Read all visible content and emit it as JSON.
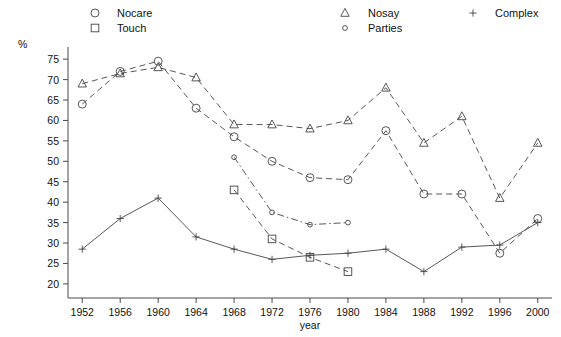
{
  "chart_data": {
    "type": "line",
    "title": "",
    "xlabel": "year",
    "ylabel": "%",
    "x": [
      1952,
      1956,
      1960,
      1964,
      1968,
      1972,
      1976,
      1980,
      1984,
      1988,
      1992,
      1996,
      2000
    ],
    "xticklabels": [
      "1952",
      "1956",
      "1960",
      "1964",
      "1968",
      "1972",
      "1976",
      "1980",
      "1984",
      "1988",
      "1992",
      "1996",
      "2000"
    ],
    "yticks": [
      20,
      25,
      30,
      35,
      40,
      45,
      50,
      55,
      60,
      65,
      70,
      75
    ],
    "yticklabels": [
      "20",
      "25",
      "30",
      "35",
      "40",
      "45",
      "50",
      "55",
      "60",
      "65",
      "70",
      "75"
    ],
    "ylim": [
      18.5,
      77
    ],
    "xlim": [
      1950.5,
      2001.5
    ],
    "grid": false,
    "legend_position": "top",
    "series": [
      {
        "name": "Nocare",
        "marker": "circle",
        "linestyle": "dashed",
        "color": "#444444",
        "x": [
          1952,
          1956,
          1960,
          1964,
          1968,
          1972,
          1976,
          1980,
          1984,
          1988,
          1992,
          1996,
          2000
        ],
        "values": [
          64.0,
          72.0,
          74.5,
          63.0,
          56.0,
          50.0,
          46.0,
          45.5,
          57.5,
          42.0,
          42.0,
          27.5,
          36.0
        ]
      },
      {
        "name": "Touch",
        "marker": "square",
        "linestyle": "dashed",
        "color": "#444444",
        "x": [
          1968,
          1972,
          1976,
          1980
        ],
        "values": [
          43.0,
          31.0,
          26.5,
          23.0
        ]
      },
      {
        "name": "Nosay",
        "marker": "triangle",
        "linestyle": "dashed",
        "color": "#444444",
        "x": [
          1952,
          1956,
          1960,
          1964,
          1968,
          1972,
          1976,
          1980,
          1984,
          1988,
          1992,
          1996,
          2000
        ],
        "values": [
          69.0,
          71.5,
          73.0,
          70.5,
          59.0,
          59.0,
          58.0,
          60.0,
          68.0,
          54.5,
          61.0,
          41.0,
          54.5
        ]
      },
      {
        "name": "Parties",
        "marker": "dot",
        "linestyle": "dashdot",
        "color": "#444444",
        "x": [
          1968,
          1972,
          1976,
          1980
        ],
        "values": [
          51.0,
          37.5,
          34.5,
          35.0
        ]
      },
      {
        "name": "Complex",
        "marker": "plus",
        "linestyle": "solid",
        "color": "#444444",
        "x": [
          1952,
          1956,
          1960,
          1964,
          1968,
          1972,
          1976,
          1980,
          1984,
          1988,
          1992,
          1996,
          2000
        ],
        "values": [
          28.5,
          36.0,
          41.0,
          31.5,
          28.5,
          26.0,
          27.0,
          27.5,
          28.5,
          23.0,
          29.0,
          29.5,
          35.0
        ]
      }
    ],
    "legend": [
      {
        "label": "Nocare",
        "marker": "circle"
      },
      {
        "label": "Touch",
        "marker": "square"
      },
      {
        "label": "Nosay",
        "marker": "triangle"
      },
      {
        "label": "Parties",
        "marker": "dot"
      },
      {
        "label": "Complex",
        "marker": "plus"
      }
    ]
  }
}
